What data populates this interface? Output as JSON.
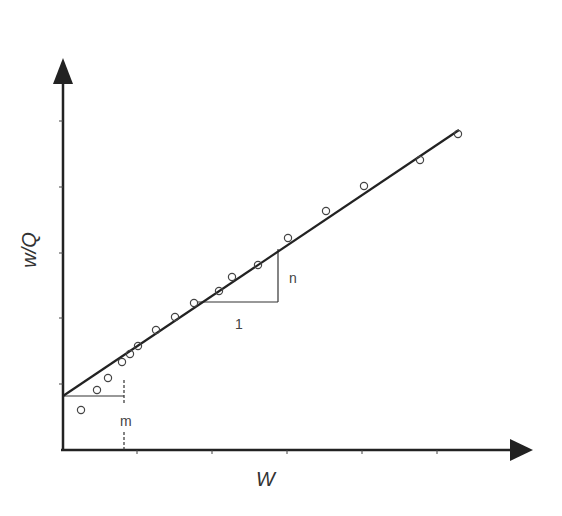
{
  "chart_data": {
    "type": "scatter",
    "title": "",
    "xlabel": "W",
    "ylabel": "w/Q",
    "grid": false,
    "legend": null,
    "x_ticks_px": [
      137,
      212,
      287,
      362,
      437
    ],
    "y_ticks_px": [
      121,
      187,
      253,
      318,
      384
    ],
    "points_px": [
      [
        81,
        410
      ],
      [
        97,
        390
      ],
      [
        108,
        378
      ],
      [
        122,
        362
      ],
      [
        130,
        354
      ],
      [
        138,
        346
      ],
      [
        156,
        330
      ],
      [
        175,
        317
      ],
      [
        194,
        303
      ],
      [
        219,
        291
      ],
      [
        232,
        277
      ],
      [
        258,
        265
      ],
      [
        288,
        238
      ],
      [
        326,
        211
      ],
      [
        364,
        186
      ],
      [
        420,
        160
      ],
      [
        458,
        134
      ]
    ],
    "fit_line_px": {
      "x1": 63,
      "y1": 396,
      "x2": 459,
      "y2": 130
    },
    "annotations": {
      "slope_label": "n",
      "run_label": "1",
      "intercept_label": "m"
    },
    "series": [
      {
        "name": "data",
        "marker": "open-circle"
      },
      {
        "name": "linear fit",
        "style": "solid-line"
      }
    ]
  },
  "labels": {
    "x_axis": "W",
    "y_axis": "w/Q",
    "n": "n",
    "one": "1",
    "m": "m"
  },
  "colors": {
    "axis": "#222222",
    "line": "#222222",
    "marker": "#444444",
    "annotation": "#444444"
  }
}
